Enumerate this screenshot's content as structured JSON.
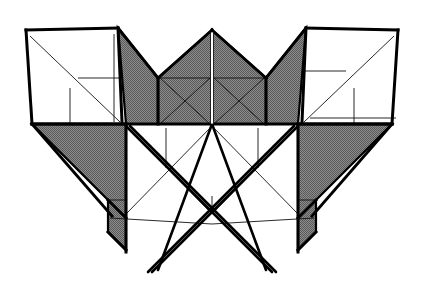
{
  "figure": {
    "title": "Symmetric frame structure line drawing",
    "type": "technical-line-drawing",
    "width": 427,
    "height": 286,
    "background_color": "#ffffff",
    "ink_color": "#000000",
    "shade_color": "#808080",
    "panel_fill_white": "#ffffff"
  },
  "geometry": {
    "view_box": "0 0 427 286",
    "stroke_widths": {
      "heavy": 3.0,
      "medium": 2.0,
      "thin": 1.0,
      "hairline": 0.9
    },
    "shaded_polygons": [
      {
        "name": "center-left-gable",
        "points": "212,30 158,78 158,124 212,124",
        "fill": "#808080"
      },
      {
        "name": "center-right-gable",
        "points": "212,30 266,78 266,124 212,124",
        "fill": "#808080"
      },
      {
        "name": "left-upper-wing",
        "points": "118,28 158,78 158,124 126,124",
        "fill": "#808080"
      },
      {
        "name": "right-upper-wing",
        "points": "306,28 266,78 266,124 298,124",
        "fill": "#808080"
      },
      {
        "name": "left-lower-wing",
        "points": "32,124 126,124 126,250 108,232 108,200 32,124",
        "fill": "#808080"
      },
      {
        "name": "right-lower-wing",
        "points": "392,124 298,124 298,250 316,232 316,200 392,124",
        "fill": "#808080"
      }
    ],
    "white_polygons": [
      {
        "name": "left-side-panel",
        "points": "26,30 118,28 122,122 32,124",
        "fill": "#ffffff"
      },
      {
        "name": "right-side-panel",
        "points": "398,30 306,28 302,122 392,124",
        "fill": "#ffffff"
      }
    ],
    "heavy_lines": [
      {
        "name": "left-panel-top-edge",
        "x1": 26,
        "y1": 30,
        "x2": 118,
        "y2": 28
      },
      {
        "name": "left-panel-left-edge",
        "x1": 26,
        "y1": 30,
        "x2": 32,
        "y2": 124
      },
      {
        "name": "left-panel-right-edge",
        "x1": 118,
        "y1": 28,
        "x2": 122,
        "y2": 122
      },
      {
        "name": "left-panel-bottom-edge",
        "x1": 32,
        "y1": 124,
        "x2": 126,
        "y2": 124
      },
      {
        "name": "right-panel-top-edge",
        "x1": 398,
        "y1": 30,
        "x2": 306,
        "y2": 28
      },
      {
        "name": "right-panel-right-edge",
        "x1": 398,
        "y1": 30,
        "x2": 392,
        "y2": 124
      },
      {
        "name": "right-panel-left-edge",
        "x1": 306,
        "y1": 28,
        "x2": 302,
        "y2": 122
      },
      {
        "name": "right-panel-bottom-edge",
        "x1": 392,
        "y1": 124,
        "x2": 298,
        "y2": 124
      },
      {
        "name": "left-gable-slope",
        "x1": 118,
        "y1": 28,
        "x2": 158,
        "y2": 78
      },
      {
        "name": "right-gable-slope",
        "x1": 306,
        "y1": 28,
        "x2": 266,
        "y2": 78
      },
      {
        "name": "apex-left-slope",
        "x1": 212,
        "y1": 30,
        "x2": 158,
        "y2": 78
      },
      {
        "name": "apex-right-slope",
        "x1": 212,
        "y1": 30,
        "x2": 266,
        "y2": 78
      },
      {
        "name": "center-left-vertical",
        "x1": 158,
        "y1": 78,
        "x2": 158,
        "y2": 124
      },
      {
        "name": "center-right-vertical",
        "x1": 266,
        "y1": 78,
        "x2": 266,
        "y2": 124
      },
      {
        "name": "base-line",
        "x1": 32,
        "y1": 124,
        "x2": 392,
        "y2": 124
      },
      {
        "name": "left-post",
        "x1": 126,
        "y1": 124,
        "x2": 126,
        "y2": 252
      },
      {
        "name": "right-post",
        "x1": 298,
        "y1": 124,
        "x2": 298,
        "y2": 252
      },
      {
        "name": "left-wing-hypotenuse",
        "x1": 32,
        "y1": 124,
        "x2": 112,
        "y2": 216
      },
      {
        "name": "right-wing-hypotenuse",
        "x1": 392,
        "y1": 124,
        "x2": 312,
        "y2": 216
      },
      {
        "name": "left-foot-notch",
        "x1": 108,
        "y1": 200,
        "x2": 126,
        "y2": 218
      },
      {
        "name": "right-foot-notch",
        "x1": 316,
        "y1": 200,
        "x2": 298,
        "y2": 218
      },
      {
        "name": "left-foot-lower",
        "x1": 108,
        "y1": 232,
        "x2": 126,
        "y2": 250
      },
      {
        "name": "right-foot-lower",
        "x1": 316,
        "y1": 232,
        "x2": 298,
        "y2": 250
      }
    ],
    "strut_lines": [
      {
        "name": "strut-left-upper-to-center",
        "x1": 126,
        "y1": 126,
        "x2": 272,
        "y2": 272
      },
      {
        "name": "strut-left-upper-to-center-b",
        "x1": 130,
        "y1": 126,
        "x2": 276,
        "y2": 272
      },
      {
        "name": "strut-right-upper-to-center",
        "x1": 298,
        "y1": 126,
        "x2": 152,
        "y2": 272
      },
      {
        "name": "strut-right-upper-to-center-b",
        "x1": 294,
        "y1": 126,
        "x2": 148,
        "y2": 272
      },
      {
        "name": "strut-center-left-leg",
        "x1": 212,
        "y1": 124,
        "x2": 158,
        "y2": 270
      },
      {
        "name": "strut-center-right-leg",
        "x1": 212,
        "y1": 124,
        "x2": 266,
        "y2": 270
      }
    ],
    "thin_lines": [
      {
        "name": "left-panel-diagonal",
        "x1": 30,
        "y1": 36,
        "x2": 120,
        "y2": 122
      },
      {
        "name": "left-panel-h-brace",
        "x1": 78,
        "y1": 78,
        "x2": 122,
        "y2": 78
      },
      {
        "name": "left-panel-v-brace",
        "x1": 70,
        "y1": 88,
        "x2": 70,
        "y2": 124
      },
      {
        "name": "left-panel-inner-vertical",
        "x1": 114,
        "y1": 34,
        "x2": 114,
        "y2": 122
      },
      {
        "name": "right-panel-diagonal",
        "x1": 394,
        "y1": 36,
        "x2": 304,
        "y2": 122
      },
      {
        "name": "right-panel-h-brace",
        "x1": 346,
        "y1": 71,
        "x2": 302,
        "y2": 71
      },
      {
        "name": "right-panel-v-brace",
        "x1": 354,
        "y1": 88,
        "x2": 354,
        "y2": 124
      },
      {
        "name": "right-panel-inner-horizontal",
        "x1": 310,
        "y1": 118,
        "x2": 396,
        "y2": 118
      },
      {
        "name": "center-left-h-brace",
        "x1": 160,
        "y1": 78,
        "x2": 210,
        "y2": 78
      },
      {
        "name": "center-right-h-brace",
        "x1": 214,
        "y1": 78,
        "x2": 264,
        "y2": 78
      },
      {
        "name": "center-left-diag-a",
        "x1": 160,
        "y1": 78,
        "x2": 210,
        "y2": 124
      },
      {
        "name": "center-left-diag-b",
        "x1": 210,
        "y1": 78,
        "x2": 160,
        "y2": 124
      },
      {
        "name": "center-right-diag-a",
        "x1": 214,
        "y1": 78,
        "x2": 264,
        "y2": 124
      },
      {
        "name": "center-right-diag-b",
        "x1": 264,
        "y1": 78,
        "x2": 214,
        "y2": 124
      },
      {
        "name": "lower-left-diag-up",
        "x1": 126,
        "y1": 126,
        "x2": 212,
        "y2": 214
      },
      {
        "name": "lower-right-diag-up",
        "x1": 298,
        "y1": 126,
        "x2": 212,
        "y2": 214
      },
      {
        "name": "lower-left-diag-down",
        "x1": 126,
        "y1": 214,
        "x2": 212,
        "y2": 126
      },
      {
        "name": "lower-right-diag-down",
        "x1": 298,
        "y1": 214,
        "x2": 212,
        "y2": 126
      },
      {
        "name": "lower-h-brace-left",
        "x1": 110,
        "y1": 218,
        "x2": 212,
        "y2": 224
      },
      {
        "name": "lower-h-brace-right",
        "x1": 314,
        "y1": 218,
        "x2": 212,
        "y2": 224
      },
      {
        "name": "lower-v-brace-left",
        "x1": 166,
        "y1": 128,
        "x2": 166,
        "y2": 168
      },
      {
        "name": "lower-v-brace-right",
        "x1": 258,
        "y1": 128,
        "x2": 258,
        "y2": 168
      },
      {
        "name": "center-v-brace",
        "x1": 212,
        "y1": 196,
        "x2": 212,
        "y2": 214
      },
      {
        "name": "left-notch-thin",
        "x1": 108,
        "y1": 200,
        "x2": 126,
        "y2": 200
      },
      {
        "name": "right-notch-thin",
        "x1": 316,
        "y1": 200,
        "x2": 298,
        "y2": 200
      }
    ],
    "center_white_stripe": {
      "name": "center-white-stripe",
      "x": 210.5,
      "y": 32,
      "width": 3,
      "height": 92,
      "fill": "#ffffff"
    }
  }
}
